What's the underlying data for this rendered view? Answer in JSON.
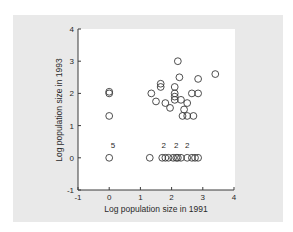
{
  "chart_data": {
    "type": "scatter",
    "title": "",
    "xlabel": "Log population size in 1991",
    "ylabel": "Log population size in 1993",
    "xlim": [
      -1,
      4
    ],
    "ylim": [
      -1,
      4
    ],
    "xticks": [
      "-1",
      "0",
      "1",
      "2",
      "3",
      "4"
    ],
    "yticks": [
      "-1",
      "0",
      "1",
      "2",
      "3",
      "4"
    ],
    "grid": false,
    "legend": null,
    "marker": "open-circle",
    "colors": {
      "panel": "#e9e9e9",
      "plot": "#ffffff",
      "ink": "#3a3a3a"
    },
    "points": [
      {
        "x": 0.0,
        "y": 2.05
      },
      {
        "x": 0.0,
        "y": 2.0
      },
      {
        "x": 0.0,
        "y": 1.3
      },
      {
        "x": 0.0,
        "y": 0.0,
        "count": 5
      },
      {
        "x": 2.2,
        "y": 3.0
      },
      {
        "x": 2.25,
        "y": 2.5
      },
      {
        "x": 2.85,
        "y": 2.45
      },
      {
        "x": 3.4,
        "y": 2.6
      },
      {
        "x": 1.65,
        "y": 2.3
      },
      {
        "x": 1.65,
        "y": 2.2
      },
      {
        "x": 2.1,
        "y": 2.2
      },
      {
        "x": 1.35,
        "y": 2.0
      },
      {
        "x": 2.1,
        "y": 2.0
      },
      {
        "x": 2.1,
        "y": 1.9
      },
      {
        "x": 2.1,
        "y": 1.8
      },
      {
        "x": 2.3,
        "y": 1.8
      },
      {
        "x": 2.65,
        "y": 2.0
      },
      {
        "x": 2.85,
        "y": 2.0
      },
      {
        "x": 1.5,
        "y": 1.75
      },
      {
        "x": 1.8,
        "y": 1.7
      },
      {
        "x": 1.95,
        "y": 1.55
      },
      {
        "x": 2.5,
        "y": 1.7
      },
      {
        "x": 2.4,
        "y": 1.5
      },
      {
        "x": 2.35,
        "y": 1.3
      },
      {
        "x": 2.5,
        "y": 1.3
      },
      {
        "x": 2.7,
        "y": 1.3
      },
      {
        "x": 1.3,
        "y": 0.0
      },
      {
        "x": 1.7,
        "y": 0.0
      },
      {
        "x": 1.8,
        "y": 0.0,
        "count": 2
      },
      {
        "x": 1.9,
        "y": 0.0
      },
      {
        "x": 2.05,
        "y": 0.0
      },
      {
        "x": 2.15,
        "y": 0.0
      },
      {
        "x": 2.2,
        "y": 0.0,
        "count": 2
      },
      {
        "x": 2.3,
        "y": 0.0
      },
      {
        "x": 2.5,
        "y": 0.0,
        "count": 2
      },
      {
        "x": 2.65,
        "y": 0.0
      },
      {
        "x": 2.75,
        "y": 0.0
      },
      {
        "x": 2.85,
        "y": 0.0
      }
    ],
    "annotations": [
      {
        "text": "5",
        "x": 0.12,
        "y": 0.3
      },
      {
        "text": "2",
        "x": 1.75,
        "y": 0.3
      },
      {
        "text": "2",
        "x": 2.15,
        "y": 0.3
      },
      {
        "text": "2",
        "x": 2.5,
        "y": 0.3
      }
    ]
  }
}
